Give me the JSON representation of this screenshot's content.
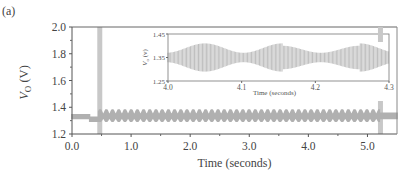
{
  "panel_label": "(a)",
  "chart_data": {
    "type": "line",
    "title": "",
    "xlabel": "Time (seconds)",
    "ylabel": "V_O (V)",
    "ylabel_main": "V",
    "ylabel_sub": "O",
    "ylabel_unit": " (V)",
    "xlim": [
      0.0,
      5.5
    ],
    "ylim": [
      1.2,
      2.0
    ],
    "xticks": [
      0.0,
      1.0,
      2.0,
      3.0,
      4.0,
      5.0
    ],
    "xtick_labels": [
      "0.0",
      "1.0",
      "2.0",
      "3.0",
      "4.0",
      "5.0"
    ],
    "yticks": [
      1.2,
      1.4,
      1.6,
      1.8,
      2.0
    ],
    "ytick_labels": [
      "1.2",
      "1.4",
      "1.6",
      "1.8",
      "2.0"
    ],
    "grid": false,
    "legend": null,
    "series": [
      {
        "name": "Output voltage V_O",
        "color": "#b0b0b0",
        "description": "Steady ~1.32 V from 0 to ~0.45 s, then oscillation between ~1.29 and ~1.38 V until ~5.2 s, then returns to ~1.33 V",
        "segments": [
          {
            "t_start": 0.0,
            "t_end": 0.3,
            "mean": 1.33,
            "min": 1.31,
            "max": 1.35
          },
          {
            "t_start": 0.3,
            "t_end": 0.45,
            "mean": 1.31,
            "min": 1.29,
            "max": 1.33
          },
          {
            "t_start": 0.45,
            "t_end": 5.2,
            "mean": 1.335,
            "min": 1.29,
            "max": 1.385,
            "oscillation_period_s": 0.105
          },
          {
            "t_start": 5.2,
            "t_end": 5.5,
            "mean": 1.33,
            "min": 1.31,
            "max": 1.36
          }
        ]
      }
    ],
    "annotations": [
      {
        "type": "vertical-band",
        "x": 0.47,
        "color": "#c8c8c8"
      },
      {
        "type": "vertical-band",
        "x": 5.22,
        "color": "#c8c8c8"
      }
    ],
    "inset": {
      "type": "line",
      "xlabel": "Time (seconds)",
      "ylabel": "V_O (V)",
      "xlim": [
        4.0,
        4.3
      ],
      "ylim": [
        1.25,
        1.45
      ],
      "xticks": [
        4.0,
        4.1,
        4.2,
        4.3
      ],
      "xtick_labels": [
        "4.0",
        "4.1",
        "4.2",
        "4.3"
      ],
      "yticks": [
        1.25,
        1.35,
        1.45
      ],
      "ytick_labels": [
        "1.25",
        "1.35",
        "1.45"
      ],
      "series": [
        {
          "name": "Output voltage V_O (zoom)",
          "color": "#b8b8b8",
          "description": "High-frequency ripple with slow envelope modulation (~0.105 s period)",
          "envelope_peaks": [
            {
              "t": 4.05,
              "max": 1.41,
              "min": 1.29
            },
            {
              "t": 4.16,
              "max": 1.39,
              "min": 1.31
            },
            {
              "t": 4.265,
              "max": 1.41,
              "min": 1.29
            }
          ],
          "envelope_troughs": [
            {
              "t": 4.0,
              "max": 1.37,
              "min": 1.33
            },
            {
              "t": 4.11,
              "max": 1.37,
              "min": 1.33
            },
            {
              "t": 4.215,
              "max": 1.37,
              "min": 1.33
            }
          ]
        }
      ]
    }
  }
}
